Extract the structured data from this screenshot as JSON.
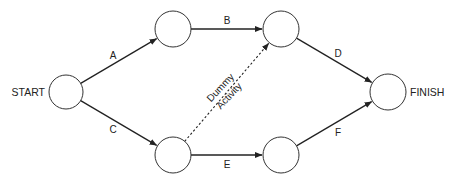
{
  "diagram": {
    "type": "activity-on-arrow network",
    "colors": {
      "line": "#222222",
      "node_stroke": "#333333",
      "background": "#ffffff"
    },
    "nodes": [
      {
        "id": "start",
        "label": "START",
        "x": 66,
        "y": 92,
        "r": 17,
        "label_side": "left"
      },
      {
        "id": "n1",
        "label": "",
        "x": 173,
        "y": 29,
        "r": 18
      },
      {
        "id": "n2",
        "label": "",
        "x": 281,
        "y": 29,
        "r": 18
      },
      {
        "id": "n3",
        "label": "",
        "x": 173,
        "y": 155,
        "r": 18
      },
      {
        "id": "n4",
        "label": "",
        "x": 281,
        "y": 155,
        "r": 18
      },
      {
        "id": "finish",
        "label": "FINISH",
        "x": 388,
        "y": 92,
        "r": 18,
        "label_side": "right"
      }
    ],
    "edges": [
      {
        "id": "A",
        "label": "A",
        "from": "start",
        "to": "n1",
        "style": "solid",
        "lx": 113,
        "ly": 59
      },
      {
        "id": "B",
        "label": "B",
        "from": "n1",
        "to": "n2",
        "style": "solid",
        "lx": 227,
        "ly": 24
      },
      {
        "id": "C",
        "label": "C",
        "from": "start",
        "to": "n3",
        "style": "solid",
        "lx": 113,
        "ly": 133
      },
      {
        "id": "D",
        "label": "D",
        "from": "n2",
        "to": "finish",
        "style": "solid",
        "lx": 338,
        "ly": 57
      },
      {
        "id": "E",
        "label": "E",
        "from": "n3",
        "to": "n4",
        "style": "solid",
        "lx": 227,
        "ly": 168
      },
      {
        "id": "F",
        "label": "F",
        "from": "n4",
        "to": "finish",
        "style": "solid",
        "lx": 338,
        "ly": 136
      },
      {
        "id": "dummy",
        "label": "",
        "from": "n3",
        "to": "n2",
        "style": "dashed"
      }
    ],
    "dummy_label": {
      "line1": "Dummy",
      "line2": "Activity",
      "x": 225,
      "y": 92,
      "rotate": -47
    }
  }
}
